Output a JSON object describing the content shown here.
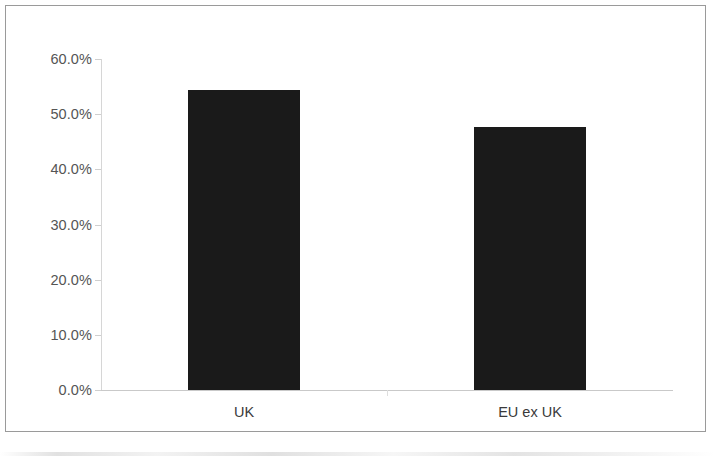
{
  "chart_data": {
    "type": "bar",
    "title": "",
    "subtitle": "",
    "xlabel": "",
    "ylabel": "",
    "categories": [
      "UK",
      "EU ex UK"
    ],
    "values": [
      54.3,
      47.6
    ],
    "value_labels": [
      "",
      ""
    ],
    "series": [
      {
        "name": "",
        "values": [
          54.3,
          47.6
        ]
      }
    ],
    "ylim": [
      0,
      60
    ],
    "y_tick_values": [
      0,
      10,
      20,
      30,
      40,
      50,
      60
    ],
    "y_tick_labels": [
      "0.0%",
      "10.0%",
      "20.0%",
      "30.0%",
      "40.0%",
      "50.0%",
      "60.0%"
    ],
    "grid": false,
    "legend": false,
    "legend_position": "none",
    "bar_color": "#1a1a1a",
    "axis_color": "#cccccc",
    "tick_label_color": "#555555",
    "frame_border_color": "#9a9a9a",
    "background_color": "#ffffff"
  }
}
